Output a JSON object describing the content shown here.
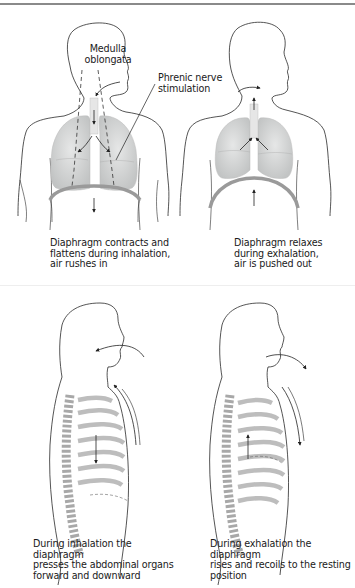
{
  "figure": {
    "panels": [
      {
        "id": "front-inhalation",
        "labels": {
          "medulla_line1": "Medulla",
          "medulla_line2": "oblongata",
          "phrenic_line1": "Phrenic nerve",
          "phrenic_line2": "stimulation"
        },
        "caption_lines": [
          "Diaphragm contracts and",
          "flattens during inhalation,",
          "air rushes in"
        ]
      },
      {
        "id": "front-exhalation",
        "caption_lines": [
          "Diaphragm relaxes",
          "during exhalation,",
          "air is pushed out"
        ]
      },
      {
        "id": "side-inhalation",
        "caption_lines": [
          "During inhalation the diaphragm",
          "presses the abdominal organs",
          "forward and downward"
        ]
      },
      {
        "id": "side-exhalation",
        "caption_lines": [
          "During exhalation the diaphragm",
          "rises and recoils to the resting",
          "position"
        ]
      }
    ]
  },
  "colors": {
    "outline": "#2a2a2a",
    "lung_fill": "#d4d6d6",
    "diaphragm": "#9a9a9a",
    "rib": "#bdbdbd",
    "spine": "#a8a8a8"
  }
}
